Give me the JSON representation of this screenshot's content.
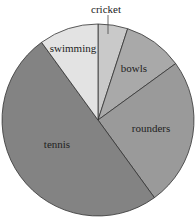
{
  "chart_data": {
    "type": "pie",
    "title": "",
    "categories": [
      "cricket",
      "bowls",
      "rounders",
      "tennis",
      "swimming"
    ],
    "values": [
      5,
      10,
      25,
      50,
      10
    ],
    "colors": [
      "#c9c9c9",
      "#a9a9a9",
      "#9a9a9a",
      "#838383",
      "#e3e3e3"
    ],
    "start_angle_deg": 0,
    "direction": "clockwise",
    "labels": [
      {
        "text": "cricket",
        "x": 106,
        "y": 9
      },
      {
        "text": "bowls",
        "x": 134,
        "y": 68
      },
      {
        "text": "rounders",
        "x": 151,
        "y": 128
      },
      {
        "text": "tennis",
        "x": 57,
        "y": 144
      },
      {
        "text": "swimming",
        "x": 73,
        "y": 48
      }
    ],
    "legend": "none"
  }
}
